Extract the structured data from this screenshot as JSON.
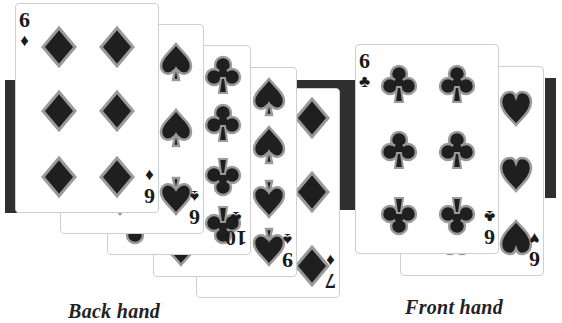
{
  "back_hand": {
    "label": "Back hand",
    "cards": [
      {
        "rank": "6",
        "suit": "diamonds",
        "suit_glyph": "♦"
      },
      {
        "rank": "6",
        "suit": "spades",
        "suit_glyph": "♠"
      },
      {
        "rank": "10",
        "suit": "clubs",
        "suit_glyph": "♣"
      },
      {
        "rank": "9",
        "suit": "spades",
        "suit_glyph": "♠"
      },
      {
        "rank": "7",
        "suit": "diamonds",
        "suit_glyph": "♦"
      }
    ]
  },
  "front_hand": {
    "label": "Front hand",
    "cards": [
      {
        "rank": "6",
        "suit": "clubs",
        "suit_glyph": "♣"
      },
      {
        "rank": "6",
        "suit": "hearts",
        "suit_glyph": "♥"
      }
    ]
  },
  "colors": {
    "bar": "#2f2f2f",
    "pip_fill": "#1f1f1f",
    "pip_outline": "#9a9a9a",
    "card_border": "#cfcfcf"
  }
}
